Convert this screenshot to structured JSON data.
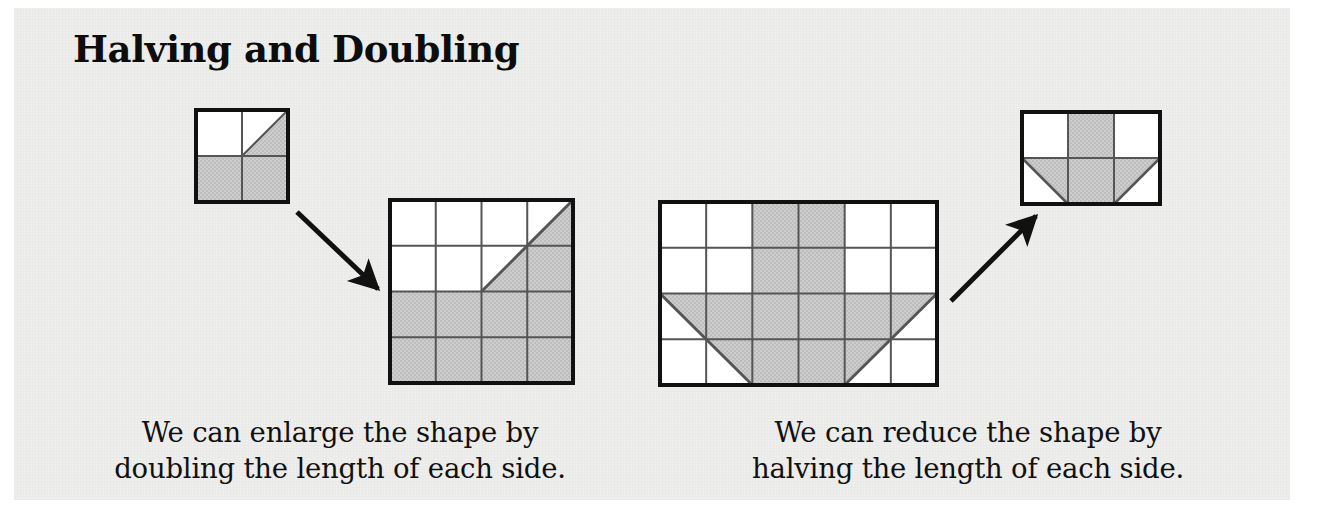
{
  "page": {
    "title": "Halving and Doubling",
    "background_color": "#ffffff",
    "sheet_color": "#eeeeec",
    "ink_color": "#111111",
    "shade_color": "#c9c9c9",
    "grid_line_color": "#555555",
    "outline_color": "#111111"
  },
  "captions": {
    "left": {
      "line1": "We can enlarge the shape by",
      "line2": "doubling the length of each side."
    },
    "right": {
      "line1": "We can reduce the shape by",
      "line2": "halving the length of each side."
    }
  },
  "figures": {
    "small_square": {
      "name": "original-square-shape",
      "columns": 2,
      "rows": 2,
      "description": "2 by 2 grid: bottom row shaded, top-right cell split by a diagonal with the lower-right triangle shaded"
    },
    "doubled_square": {
      "name": "doubled-square-shape",
      "columns": 4,
      "rows": 4,
      "description": "4 by 4 grid: bottom two rows shaded, diagonal from centre to top-right corner with region to the right shaded"
    },
    "large_rectangle": {
      "name": "original-rectangle-shape",
      "columns": 6,
      "rows": 4,
      "description": "6 by 4 grid: middle two columns shaded full height plus a trapezoid across the bottom two rows"
    },
    "halved_rectangle": {
      "name": "halved-rectangle-shape",
      "columns": 3,
      "rows": 2,
      "description": "3 by 2 grid: middle column shaded full height plus a trapezoid across the bottom row"
    }
  },
  "arrows": {
    "enlarge": {
      "label": "enlarge-arrow",
      "direction": "down-right"
    },
    "reduce": {
      "label": "reduce-arrow",
      "direction": "up-right"
    }
  }
}
